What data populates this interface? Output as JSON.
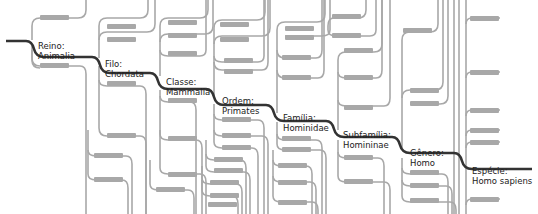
{
  "diagram": {
    "type": "taxonomy-tree",
    "colors": {
      "main_path": "#333333",
      "branch": "#a8a8a8",
      "placeholder": "#a8a8a8",
      "text": "#222222",
      "background": "#ffffff"
    },
    "main_path": [
      {
        "rank": "Reino:",
        "name": "Animalia",
        "x": 38,
        "y": 41
      },
      {
        "rank": "Filo:",
        "name": "Chordata",
        "x": 105,
        "y": 59
      },
      {
        "rank": "Classe:",
        "name": "Mammalia",
        "x": 166,
        "y": 77
      },
      {
        "rank": "Ordem:",
        "name": "Primates",
        "x": 222,
        "y": 96
      },
      {
        "rank": "Família:",
        "name": "Hominidae",
        "x": 283,
        "y": 113
      },
      {
        "rank": "Subfamília:",
        "name": "Homininae",
        "x": 343,
        "y": 130
      },
      {
        "rank": "Gênero:",
        "name": "Homo",
        "x": 410,
        "y": 148
      },
      {
        "rank": "Espécie:",
        "name": "Homo sapiens",
        "x": 472,
        "y": 166
      }
    ],
    "placeholder_labels": [
      [
        40,
        15
      ],
      [
        40,
        63
      ],
      [
        107,
        24
      ],
      [
        107,
        37
      ],
      [
        107,
        81
      ],
      [
        107,
        133
      ],
      [
        94,
        153
      ],
      [
        94,
        177
      ],
      [
        168,
        20
      ],
      [
        168,
        33
      ],
      [
        168,
        51
      ],
      [
        168,
        98
      ],
      [
        168,
        136
      ],
      [
        168,
        172
      ],
      [
        156,
        187
      ],
      [
        220,
        22
      ],
      [
        220,
        37
      ],
      [
        224,
        58
      ],
      [
        224,
        69
      ],
      [
        222,
        117
      ],
      [
        222,
        133
      ],
      [
        222,
        145
      ],
      [
        214,
        157
      ],
      [
        214,
        168
      ],
      [
        210,
        180
      ],
      [
        210,
        193
      ],
      [
        208,
        202
      ],
      [
        285,
        26
      ],
      [
        285,
        35
      ],
      [
        282,
        55
      ],
      [
        282,
        75
      ],
      [
        282,
        136
      ],
      [
        282,
        147
      ],
      [
        278,
        163
      ],
      [
        278,
        180
      ],
      [
        278,
        200
      ],
      [
        332,
        14
      ],
      [
        332,
        33
      ],
      [
        344,
        48
      ],
      [
        344,
        75
      ],
      [
        344,
        105
      ],
      [
        344,
        155
      ],
      [
        344,
        179
      ],
      [
        403,
        28
      ],
      [
        410,
        88
      ],
      [
        410,
        101
      ],
      [
        410,
        170
      ],
      [
        410,
        183
      ],
      [
        410,
        198
      ],
      [
        470,
        16
      ],
      [
        470,
        70
      ],
      [
        470,
        108
      ],
      [
        470,
        128
      ],
      [
        470,
        140
      ],
      [
        470,
        197
      ]
    ]
  }
}
